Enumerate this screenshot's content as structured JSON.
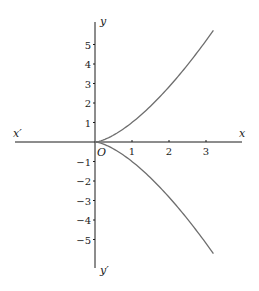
{
  "chart_data": {
    "type": "line",
    "title": "",
    "xlabel": "x",
    "ylabel": "y",
    "axis_labels": {
      "x_positive": "x",
      "x_negative": "x′",
      "y_positive": "y",
      "y_negative": "y′",
      "origin": "O"
    },
    "x_ticks": [
      "1",
      "2",
      "3"
    ],
    "y_ticks": [
      "5",
      "4",
      "3",
      "2",
      "1",
      "−1",
      "−2",
      "−3",
      "−4",
      "−5"
    ],
    "xlim": [
      -2.2,
      4.0
    ],
    "ylim": [
      -6.4,
      6.2
    ],
    "grid": false,
    "legend": null,
    "series": [
      {
        "name": "upper branch y = x^(3/2)",
        "x": [
          0,
          0.5,
          1,
          1.5,
          2,
          2.5,
          3,
          3.2
        ],
        "y": [
          0,
          0.35,
          1.0,
          1.84,
          2.83,
          3.95,
          5.2,
          5.72
        ]
      },
      {
        "name": "lower branch y = -x^(3/2)",
        "x": [
          0,
          0.5,
          1,
          1.5,
          2,
          2.5,
          3,
          3.2
        ],
        "y": [
          0,
          -0.35,
          -1.0,
          -1.84,
          -2.83,
          -3.95,
          -5.2,
          -5.72
        ]
      }
    ],
    "annotation": "Semicubical parabola y² = x³",
    "colors": {
      "axis": "#1a1a1a",
      "curve": "#6e6e6e"
    }
  }
}
